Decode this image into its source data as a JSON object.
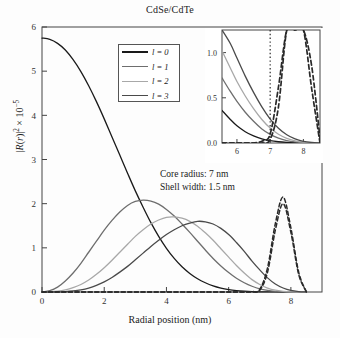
{
  "title": "CdSe/CdTe",
  "axes": {
    "xlabel": "Radial position (nm)",
    "ylabel_html": "|R(r)|² × 10⁻⁵",
    "xticks": [
      "0",
      "2",
      "4",
      "6",
      "8"
    ],
    "yticks": [
      "0",
      "1",
      "2",
      "3",
      "4",
      "5",
      "6"
    ]
  },
  "legend": {
    "items": [
      {
        "label": "l = 0",
        "color": "#1a1a1a"
      },
      {
        "label": "l = 1",
        "color": "#6e6e6e"
      },
      {
        "label": "l = 2",
        "color": "#a8a8a8"
      },
      {
        "label": "l = 3",
        "color": "#4a4a4a"
      }
    ]
  },
  "annotations": {
    "core_radius": "Core radius: 7 nm",
    "shell_width": "Shell width: 1.5 nm"
  },
  "inset": {
    "xticks": [
      "6",
      "7",
      "8"
    ],
    "yticks": [
      "0.0",
      "0.5",
      "1.0"
    ]
  },
  "chart_data": {
    "type": "line",
    "title": "CdSe/CdTe",
    "xlabel": "Radial position (nm)",
    "ylabel": "|R(r)|^2 x 10^-5",
    "xlim": [
      0,
      9
    ],
    "ylim": [
      0,
      6
    ],
    "grid": false,
    "legend_position": "upper-center-left",
    "annotations": [
      {
        "text": "Core radius: 7 nm",
        "x": 4.6,
        "y": 2.75
      },
      {
        "text": "Shell width: 1.5 nm",
        "x": 4.6,
        "y": 2.45
      },
      {
        "text": "core-shell boundary marker (dotted vertical)",
        "x": 7.0
      }
    ],
    "x": [
      0,
      0.25,
      0.5,
      0.75,
      1,
      1.25,
      1.5,
      1.75,
      2,
      2.25,
      2.5,
      2.75,
      3,
      3.25,
      3.5,
      3.75,
      4,
      4.25,
      4.5,
      4.75,
      5,
      5.25,
      5.5,
      5.75,
      6,
      6.25,
      6.5,
      6.75,
      7,
      7.25,
      7.5,
      7.75,
      8,
      8.25,
      8.5
    ],
    "series": [
      {
        "name": "l = 0",
        "color": "#1a1a1a",
        "style": "solid",
        "peak_x": 0.0,
        "peak_y": 5.75,
        "values": [
          5.75,
          5.72,
          5.63,
          5.48,
          5.26,
          4.99,
          4.67,
          4.31,
          3.92,
          3.51,
          3.1,
          2.69,
          2.29,
          1.92,
          1.57,
          1.26,
          0.99,
          0.76,
          0.57,
          0.42,
          0.3,
          0.21,
          0.14,
          0.09,
          0.055,
          0.032,
          0.018,
          0.009,
          0.004,
          0.002,
          0.001,
          0.0,
          0.0,
          0.0,
          0.0
        ]
      },
      {
        "name": "l = 1",
        "color": "#6e6e6e",
        "style": "solid",
        "peak_x": 3.4,
        "peak_y": 2.08,
        "values": [
          0.0,
          0.03,
          0.11,
          0.25,
          0.43,
          0.65,
          0.9,
          1.15,
          1.4,
          1.62,
          1.81,
          1.96,
          2.05,
          2.08,
          2.06,
          1.99,
          1.87,
          1.72,
          1.54,
          1.35,
          1.15,
          0.95,
          0.76,
          0.59,
          0.44,
          0.31,
          0.21,
          0.13,
          0.07,
          0.035,
          0.015,
          0.005,
          0.0,
          0.0,
          0.0
        ]
      },
      {
        "name": "l = 2",
        "color": "#a8a8a8",
        "style": "solid",
        "peak_x": 4.2,
        "peak_y": 1.7,
        "values": [
          0.0,
          0.005,
          0.02,
          0.05,
          0.1,
          0.17,
          0.27,
          0.4,
          0.55,
          0.72,
          0.9,
          1.08,
          1.26,
          1.41,
          1.54,
          1.63,
          1.69,
          1.7,
          1.67,
          1.6,
          1.49,
          1.34,
          1.17,
          0.98,
          0.79,
          0.6,
          0.43,
          0.28,
          0.17,
          0.09,
          0.04,
          0.015,
          0.004,
          0.0,
          0.0
        ]
      },
      {
        "name": "l = 3",
        "color": "#4a4a4a",
        "style": "solid",
        "peak_x": 4.95,
        "peak_y": 1.6,
        "values": [
          0.0,
          0.0,
          0.003,
          0.01,
          0.025,
          0.05,
          0.09,
          0.15,
          0.23,
          0.33,
          0.45,
          0.58,
          0.73,
          0.88,
          1.03,
          1.17,
          1.3,
          1.41,
          1.5,
          1.56,
          1.6,
          1.59,
          1.54,
          1.44,
          1.3,
          1.12,
          0.92,
          0.7,
          0.5,
          0.32,
          0.18,
          0.09,
          0.035,
          0.01,
          0.0
        ]
      },
      {
        "name": "shell-localized state A",
        "color": "#2a2a2a",
        "style": "dashed",
        "peak_x": 7.7,
        "peak_y": 2.15,
        "values": [
          0,
          0,
          0,
          0,
          0,
          0,
          0,
          0,
          0,
          0,
          0,
          0,
          0,
          0,
          0,
          0,
          0,
          0,
          0,
          0,
          0,
          0,
          0,
          0,
          0,
          0,
          0,
          0.01,
          0.06,
          0.55,
          1.55,
          2.15,
          1.45,
          0.45,
          0.0
        ]
      },
      {
        "name": "shell-localized state B",
        "color": "#2a2a2a",
        "style": "dashed",
        "peak_x": 7.7,
        "peak_y": 2.0,
        "values": [
          0,
          0,
          0,
          0,
          0,
          0,
          0,
          0,
          0,
          0,
          0,
          0,
          0,
          0,
          0,
          0,
          0,
          0,
          0,
          0,
          0,
          0,
          0,
          0,
          0,
          0,
          0,
          0.0,
          0.04,
          0.45,
          1.4,
          2.0,
          1.35,
          0.4,
          0.0
        ]
      }
    ],
    "inset": {
      "type": "line",
      "xlim": [
        5.55,
        8.5
      ],
      "ylim": [
        0,
        1.25
      ],
      "xticks": [
        6,
        7,
        8
      ],
      "yticks": [
        0.0,
        0.5,
        1.0
      ],
      "description": "magnified view of the core/shell boundary region near r = 7 nm showing decaying core states and rising shell states",
      "x": [
        5.55,
        5.8,
        6.0,
        6.25,
        6.5,
        6.75,
        7.0,
        7.25,
        7.5,
        7.75,
        8.0,
        8.25,
        8.5
      ],
      "series": [
        {
          "name": "l = 0",
          "color": "#1a1a1a",
          "style": "solid",
          "values": [
            0.36,
            0.26,
            0.19,
            0.125,
            0.078,
            0.046,
            0.026,
            0.014,
            0.007,
            0.003,
            0.001,
            0.0,
            0.0
          ]
        },
        {
          "name": "l = 1",
          "color": "#6e6e6e",
          "style": "solid",
          "values": [
            0.72,
            0.57,
            0.46,
            0.34,
            0.24,
            0.155,
            0.095,
            0.053,
            0.027,
            0.012,
            0.005,
            0.001,
            0.0
          ]
        },
        {
          "name": "l = 2",
          "color": "#a8a8a8",
          "style": "solid",
          "values": [
            1.02,
            0.83,
            0.68,
            0.52,
            0.38,
            0.26,
            0.165,
            0.097,
            0.052,
            0.024,
            0.009,
            0.003,
            0.0
          ]
        },
        {
          "name": "l = 3",
          "color": "#4a4a4a",
          "style": "solid",
          "values": [
            1.25,
            1.1,
            0.94,
            0.74,
            0.56,
            0.4,
            0.265,
            0.163,
            0.091,
            0.045,
            0.019,
            0.006,
            0.0
          ]
        },
        {
          "name": "shell state A",
          "color": "#2a2a2a",
          "style": "dashed",
          "values": [
            0,
            0,
            0,
            0,
            0,
            0.02,
            0.1,
            0.62,
            1.25,
            1.25,
            1.25,
            0.6,
            0.0
          ]
        },
        {
          "name": "shell state B",
          "color": "#2a2a2a",
          "style": "dashed",
          "values": [
            0,
            0,
            0,
            0,
            0,
            0.0,
            0.04,
            0.4,
            1.25,
            1.25,
            1.25,
            0.85,
            0.05
          ]
        },
        {
          "name": "core boundary",
          "color": "#2a2a2a",
          "style": "dotted",
          "vertical_at_x": 7.0
        }
      ]
    }
  }
}
